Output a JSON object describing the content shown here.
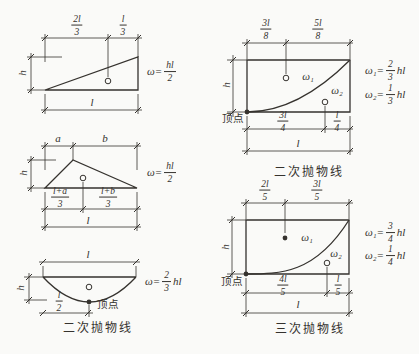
{
  "colors": {
    "background": "#fafaf8",
    "ink": "#35322e"
  },
  "figures": {
    "tl": {
      "dim_top_left": {
        "num": "2l",
        "den": "3"
      },
      "dim_top_right": {
        "num": "l",
        "den": "3"
      },
      "dim_height": "h",
      "dim_span": "l",
      "formula": {
        "lhs": "ω=",
        "num": "hl",
        "den": "2",
        "rhs": ""
      }
    },
    "ml": {
      "dim_a": "a",
      "dim_b": "b",
      "dim_height": "h",
      "dim_bot_left": {
        "num": "l+a",
        "den": "3"
      },
      "dim_bot_right": {
        "num": "l+b",
        "den": "3"
      },
      "dim_span": "l",
      "formula": {
        "lhs": "ω=",
        "num": "hl",
        "den": "2",
        "rhs": ""
      }
    },
    "bl": {
      "dim_span": "l",
      "dim_height": "h",
      "dim_half": {
        "num": "l",
        "den": "2"
      },
      "vertex_label": "顶点",
      "formula": {
        "lhs": "ω=",
        "num": "2",
        "den": "3",
        "rhs": "hl"
      },
      "caption": "二次抛物线"
    },
    "tr": {
      "dim_top_left": {
        "num": "3l",
        "den": "8"
      },
      "dim_top_right": {
        "num": "5l",
        "den": "8"
      },
      "dim_height": "h",
      "dim_bot_left": {
        "num": "3l",
        "den": "4"
      },
      "dim_bot_right": {
        "num": "l",
        "den": "4"
      },
      "dim_span": "l",
      "region1": "ω₁",
      "region2": "ω₂",
      "vertex_label": "顶点",
      "formula1": {
        "lhs": "ω₁=",
        "num": "2",
        "den": "3",
        "rhs": "hl"
      },
      "formula2": {
        "lhs": "ω₂=",
        "num": "1",
        "den": "3",
        "rhs": "hl"
      },
      "caption": "二次抛物线"
    },
    "br": {
      "dim_top_left": {
        "num": "2l",
        "den": "5"
      },
      "dim_top_right": {
        "num": "3l",
        "den": "5"
      },
      "dim_height": "h",
      "dim_bot_left": {
        "num": "4l",
        "den": "5"
      },
      "dim_bot_right": {
        "num": "l",
        "den": "5"
      },
      "dim_span": "l",
      "region1": "ω₁",
      "region2": "ω₂",
      "vertex_label": "顶点",
      "formula1": {
        "lhs": "ω₁=",
        "num": "3",
        "den": "4",
        "rhs": "hl"
      },
      "formula2": {
        "lhs": "ω₂=",
        "num": "1",
        "den": "4",
        "rhs": "hl"
      },
      "caption": "三次抛物线"
    }
  }
}
